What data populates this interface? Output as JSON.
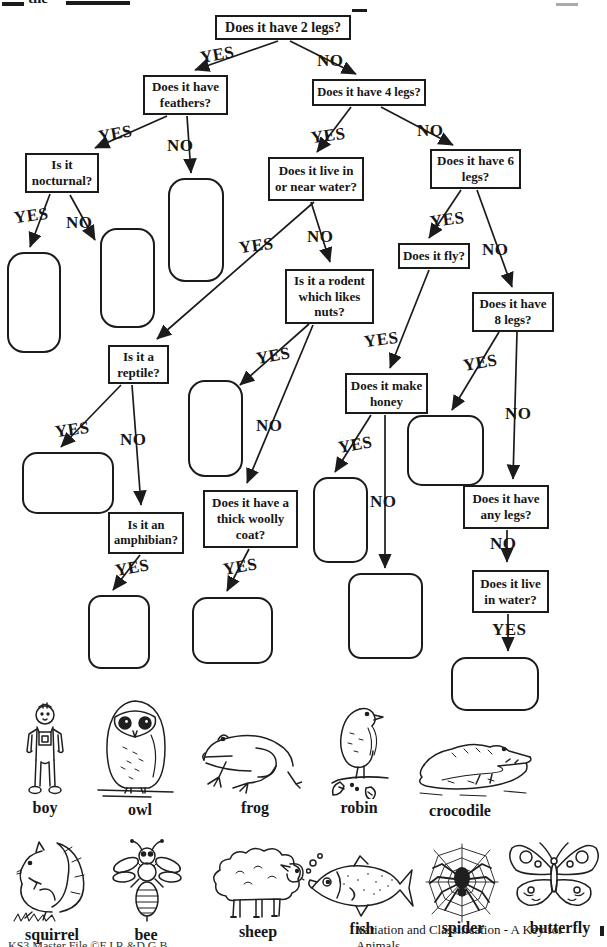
{
  "page": {
    "top_fragment": "the",
    "footer_left": "KS3 Master File ©F.J.R.&D.G.B",
    "footer_right": "Variation and Classification - A Key for Animals"
  },
  "flowchart": {
    "labels": {
      "yes": "YES",
      "no": "NO"
    },
    "questions": {
      "two_legs": "Does it have 2 legs?",
      "feathers": "Does it have feathers?",
      "four_legs": "Does it have 4 legs?",
      "nocturnal": "Is it nocturnal?",
      "near_water": "Does it live in or near water?",
      "six_legs": "Does it have 6 legs?",
      "rodent": "Is it a rodent which likes nuts?",
      "fly": "Does it fly?",
      "eight_legs": "Does it have 8 legs?",
      "reptile": "Is it a reptile?",
      "amphibian": "Is it an amphibian?",
      "woolly": "Does it have a thick woolly coat?",
      "honey": "Does it make honey",
      "any_legs": "Does it have any legs?",
      "in_water": "Does it live in water?"
    }
  },
  "animals": {
    "row1": [
      "boy",
      "owl",
      "frog",
      "robin",
      "crocodile"
    ],
    "row2": [
      "squirrel",
      "bee",
      "sheep",
      "fish",
      "spider",
      "butterfly"
    ]
  },
  "colors": {
    "ink": "#1b1b1b",
    "paper": "#ffffff"
  }
}
